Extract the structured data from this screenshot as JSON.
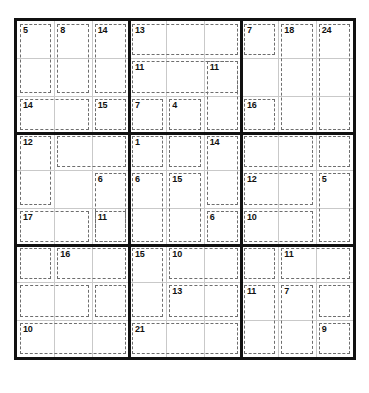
{
  "app": {
    "title": "Killer Sudoku",
    "puzzle_type": "killer-sudoku",
    "grid_size": 9
  },
  "colors": {
    "background": "#ffffff",
    "outer_border": "#111111",
    "box_border": "#111111",
    "cell_border": "#c9c9c9",
    "cage_border": "#6e6e6e",
    "sum_text": "#111111"
  },
  "grid": {
    "rows": 9,
    "columns": 9,
    "given_values": [
      [
        "",
        "",
        "",
        "",
        "",
        "",
        "",
        "",
        ""
      ],
      [
        "",
        "",
        "",
        "",
        "",
        "",
        "",
        "",
        ""
      ],
      [
        "",
        "",
        "",
        "",
        "",
        "",
        "",
        "",
        ""
      ],
      [
        "",
        "",
        "",
        "",
        "",
        "",
        "",
        "",
        ""
      ],
      [
        "",
        "",
        "",
        "",
        "",
        "",
        "",
        "",
        ""
      ],
      [
        "",
        "",
        "",
        "",
        "",
        "",
        "",
        "",
        ""
      ],
      [
        "",
        "",
        "",
        "",
        "",
        "",
        "",
        "",
        ""
      ],
      [
        "",
        "",
        "",
        "",
        "",
        "",
        "",
        "",
        ""
      ],
      [
        "",
        "",
        "",
        "",
        "",
        "",
        "",
        "",
        ""
      ]
    ]
  },
  "cages": [
    {
      "sum": "5",
      "cells": [
        [
          0,
          0
        ],
        [
          1,
          0
        ]
      ]
    },
    {
      "sum": "8",
      "cells": [
        [
          0,
          1
        ],
        [
          1,
          1
        ]
      ]
    },
    {
      "sum": "14",
      "cells": [
        [
          0,
          2
        ],
        [
          1,
          2
        ]
      ]
    },
    {
      "sum": "13",
      "cells": [
        [
          0,
          3
        ],
        [
          0,
          4
        ],
        [
          0,
          5
        ]
      ]
    },
    {
      "sum": "7",
      "cells": [
        [
          0,
          6
        ],
        [
          0,
          7
        ]
      ]
    },
    {
      "sum": "18",
      "cells": [
        [
          0,
          8
        ],
        [
          1,
          8
        ],
        [
          2,
          8
        ]
      ]
    },
    {
      "sum": "24",
      "cells": [
        [
          0,
          9
        ],
        [
          1,
          9
        ],
        [
          2,
          9
        ]
      ]
    },
    {
      "sum": "11",
      "cells": [
        [
          1,
          3
        ],
        [
          1,
          4
        ],
        [
          1,
          5
        ]
      ]
    },
    {
      "sum": "11",
      "cells": [
        [
          1,
          6
        ],
        [
          1,
          7
        ],
        [
          2,
          7
        ]
      ]
    },
    {
      "sum": "14",
      "cells": [
        [
          2,
          0
        ],
        [
          2,
          1
        ]
      ]
    },
    {
      "sum": "15",
      "cells": [
        [
          2,
          2
        ]
      ]
    },
    {
      "sum": "7",
      "cells": [
        [
          2,
          3
        ],
        [
          2,
          4
        ]
      ]
    },
    {
      "sum": "4",
      "cells": [
        [
          2,
          5
        ],
        [
          2,
          6
        ]
      ]
    },
    {
      "sum": "16",
      "cells": [
        [
          2,
          6
        ]
      ]
    },
    {
      "sum": "12",
      "cells": [
        [
          3,
          0
        ],
        [
          4,
          0
        ],
        [
          4,
          1
        ]
      ]
    },
    {
      "sum": "",
      "cells": [
        [
          3,
          1
        ],
        [
          3,
          2
        ]
      ]
    },
    {
      "sum": "1",
      "cells": [
        [
          3,
          3
        ]
      ]
    },
    {
      "sum": "",
      "cells": [
        [
          3,
          4
        ]
      ]
    },
    {
      "sum": "14",
      "cells": [
        [
          3,
          5
        ],
        [
          4,
          5
        ]
      ]
    },
    {
      "sum": "",
      "cells": [
        [
          3,
          6
        ],
        [
          3,
          7
        ],
        [
          3,
          8
        ]
      ]
    },
    {
      "sum": "",
      "cells": [
        [
          3,
          9
        ]
      ]
    },
    {
      "sum": "6",
      "cells": [
        [
          4,
          2
        ],
        [
          5,
          2
        ]
      ]
    },
    {
      "sum": "6",
      "cells": [
        [
          4,
          3
        ],
        [
          5,
          3
        ]
      ]
    },
    {
      "sum": "15",
      "cells": [
        [
          4,
          4
        ],
        [
          5,
          4
        ]
      ]
    },
    {
      "sum": "12",
      "cells": [
        [
          4,
          6
        ],
        [
          4,
          7
        ]
      ]
    },
    {
      "sum": "5",
      "cells": [
        [
          4,
          8
        ],
        [
          5,
          8
        ]
      ]
    },
    {
      "sum": "17",
      "cells": [
        [
          5,
          0
        ],
        [
          5,
          1
        ]
      ]
    },
    {
      "sum": "11",
      "cells": [
        [
          5,
          2
        ]
      ]
    },
    {
      "sum": "6",
      "cells": [
        [
          5,
          5
        ]
      ]
    },
    {
      "sum": "10",
      "cells": [
        [
          5,
          6
        ],
        [
          5,
          7
        ]
      ]
    },
    {
      "sum": "",
      "cells": [
        [
          6,
          0
        ]
      ]
    },
    {
      "sum": "16",
      "cells": [
        [
          6,
          1
        ],
        [
          6,
          2
        ],
        [
          7,
          2
        ]
      ]
    },
    {
      "sum": "15",
      "cells": [
        [
          6,
          3
        ],
        [
          7,
          3
        ]
      ]
    },
    {
      "sum": "10",
      "cells": [
        [
          6,
          4
        ],
        [
          6,
          5
        ]
      ]
    },
    {
      "sum": "",
      "cells": [
        [
          6,
          6
        ],
        [
          6,
          7
        ]
      ]
    },
    {
      "sum": "11",
      "cells": [
        [
          6,
          8
        ],
        [
          6,
          9
        ]
      ]
    },
    {
      "sum": "",
      "cells": [
        [
          7,
          0
        ],
        [
          7,
          1
        ]
      ]
    },
    {
      "sum": "13",
      "cells": [
        [
          7,
          4
        ],
        [
          7,
          5
        ]
      ]
    },
    {
      "sum": "11",
      "cells": [
        [
          7,
          6
        ],
        [
          8,
          6
        ]
      ]
    },
    {
      "sum": "7",
      "cells": [
        [
          7,
          7
        ],
        [
          8,
          7
        ]
      ]
    },
    {
      "sum": "",
      "cells": [
        [
          7,
          8
        ],
        [
          7,
          9
        ]
      ]
    },
    {
      "sum": "10",
      "cells": [
        [
          8,
          0
        ],
        [
          8,
          1
        ],
        [
          8,
          2
        ]
      ]
    },
    {
      "sum": "21",
      "cells": [
        [
          8,
          3
        ],
        [
          8,
          4
        ],
        [
          8,
          5
        ]
      ]
    },
    {
      "sum": "9",
      "cells": [
        [
          8,
          8
        ]
      ]
    }
  ],
  "cage_regions": [
    {
      "sum": "5",
      "r": 0,
      "c": 0,
      "rs": 2,
      "cs": 1
    },
    {
      "sum": "8",
      "r": 0,
      "c": 1,
      "rs": 2,
      "cs": 1
    },
    {
      "sum": "14",
      "r": 0,
      "c": 2,
      "rs": 2,
      "cs": 1
    },
    {
      "sum": "13",
      "r": 0,
      "c": 3,
      "rs": 1,
      "cs": 3
    },
    {
      "sum": "7",
      "r": 0,
      "c": 6,
      "rs": 1,
      "cs": 1
    },
    {
      "sum": "18",
      "r": 0,
      "c": 7,
      "rs": 3,
      "cs": 1
    },
    {
      "sum": "24",
      "r": 0,
      "c": 8,
      "rs": 3,
      "cs": 1
    },
    {
      "sum": "11",
      "r": 1,
      "c": 3,
      "rs": 1,
      "cs": 3
    },
    {
      "sum": "11",
      "r": 1,
      "c": 5,
      "rs": 2,
      "cs": 1
    },
    {
      "sum": "14",
      "r": 2,
      "c": 0,
      "rs": 1,
      "cs": 2
    },
    {
      "sum": "15",
      "r": 2,
      "c": 2,
      "rs": 1,
      "cs": 1
    },
    {
      "sum": "7",
      "r": 2,
      "c": 3,
      "rs": 1,
      "cs": 1
    },
    {
      "sum": "4",
      "r": 2,
      "c": 4,
      "rs": 1,
      "cs": 1
    },
    {
      "sum": "16",
      "r": 2,
      "c": 6,
      "rs": 1,
      "cs": 1
    },
    {
      "sum": "12",
      "r": 3,
      "c": 0,
      "rs": 2,
      "cs": 1
    },
    {
      "sum": "",
      "r": 3,
      "c": 1,
      "rs": 1,
      "cs": 2
    },
    {
      "sum": "1",
      "r": 3,
      "c": 3,
      "rs": 1,
      "cs": 1
    },
    {
      "sum": "",
      "r": 3,
      "c": 4,
      "rs": 1,
      "cs": 1
    },
    {
      "sum": "14",
      "r": 3,
      "c": 5,
      "rs": 2,
      "cs": 1
    },
    {
      "sum": "",
      "r": 3,
      "c": 6,
      "rs": 1,
      "cs": 2
    },
    {
      "sum": "",
      "r": 3,
      "c": 8,
      "rs": 1,
      "cs": 1
    },
    {
      "sum": "6",
      "r": 4,
      "c": 2,
      "rs": 2,
      "cs": 1
    },
    {
      "sum": "6",
      "r": 4,
      "c": 3,
      "rs": 2,
      "cs": 1
    },
    {
      "sum": "15",
      "r": 4,
      "c": 4,
      "rs": 2,
      "cs": 1
    },
    {
      "sum": "12",
      "r": 4,
      "c": 6,
      "rs": 1,
      "cs": 2
    },
    {
      "sum": "5",
      "r": 4,
      "c": 8,
      "rs": 2,
      "cs": 1
    },
    {
      "sum": "17",
      "r": 5,
      "c": 0,
      "rs": 1,
      "cs": 2
    },
    {
      "sum": "11",
      "r": 5,
      "c": 2,
      "rs": 1,
      "cs": 1
    },
    {
      "sum": "6",
      "r": 5,
      "c": 5,
      "rs": 1,
      "cs": 1
    },
    {
      "sum": "10",
      "r": 5,
      "c": 6,
      "rs": 1,
      "cs": 2
    },
    {
      "sum": "",
      "r": 6,
      "c": 0,
      "rs": 1,
      "cs": 1
    },
    {
      "sum": "16",
      "r": 6,
      "c": 1,
      "rs": 1,
      "cs": 2
    },
    {
      "sum": "15",
      "r": 6,
      "c": 3,
      "rs": 2,
      "cs": 1
    },
    {
      "sum": "10",
      "r": 6,
      "c": 4,
      "rs": 1,
      "cs": 2
    },
    {
      "sum": "",
      "r": 6,
      "c": 6,
      "rs": 1,
      "cs": 1
    },
    {
      "sum": "11",
      "r": 6,
      "c": 7,
      "rs": 1,
      "cs": 2
    },
    {
      "sum": "",
      "r": 7,
      "c": 0,
      "rs": 1,
      "cs": 2
    },
    {
      "sum": "",
      "r": 7,
      "c": 2,
      "rs": 1,
      "cs": 1
    },
    {
      "sum": "13",
      "r": 7,
      "c": 4,
      "rs": 1,
      "cs": 2
    },
    {
      "sum": "11",
      "r": 7,
      "c": 6,
      "rs": 2,
      "cs": 1
    },
    {
      "sum": "7",
      "r": 7,
      "c": 7,
      "rs": 2,
      "cs": 1
    },
    {
      "sum": "",
      "r": 7,
      "c": 8,
      "rs": 1,
      "cs": 1
    },
    {
      "sum": "10",
      "r": 8,
      "c": 0,
      "rs": 1,
      "cs": 3
    },
    {
      "sum": "21",
      "r": 8,
      "c": 3,
      "rs": 1,
      "cs": 3
    },
    {
      "sum": "9",
      "r": 8,
      "c": 8,
      "rs": 1,
      "cs": 1
    }
  ],
  "visible_sums": [
    "5",
    "8",
    "14",
    "13",
    "7",
    "18",
    "24",
    "11",
    "11",
    "14",
    "15",
    "7",
    "4",
    "16",
    "12",
    "1",
    "14",
    "6",
    "6",
    "15",
    "12",
    "5",
    "17",
    "11",
    "6",
    "10",
    "16",
    "15",
    "10",
    "11",
    "13",
    "11",
    "7",
    "10",
    "21",
    "9"
  ]
}
